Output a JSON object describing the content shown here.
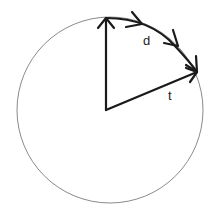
{
  "diagram": {
    "type": "circle-vector-diagram",
    "labels": {
      "d": "d",
      "t": "t"
    },
    "colors": {
      "circle": "#888888",
      "vectors": "#1a1a1a",
      "background": "#ffffff"
    },
    "elements": [
      {
        "kind": "circle",
        "center": [
          110,
          110
        ],
        "radius": 93
      },
      {
        "kind": "arrow",
        "name": "radius-up",
        "from": [
          106,
          110
        ],
        "to": [
          106,
          17
        ]
      },
      {
        "kind": "arrow",
        "name": "radius-t",
        "from": [
          106,
          110
        ],
        "to": [
          197,
          72
        ],
        "label": "t"
      },
      {
        "kind": "arc-arrows",
        "name": "displacement-d",
        "label": "d",
        "count": 3
      }
    ]
  }
}
